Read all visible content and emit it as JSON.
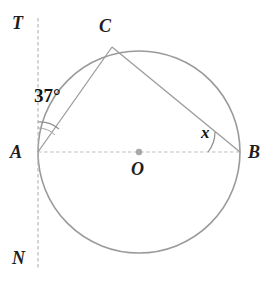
{
  "figure": {
    "type": "circle-geometry-diagram",
    "background_color": "#ffffff",
    "stroke_color_circle": "#9a9a9a",
    "stroke_color_chord": "#9b9b9b",
    "stroke_color_dashed": "#b5b5b5",
    "text_color": "#1d1d1d"
  },
  "points": [
    {
      "id": "A",
      "label": "A",
      "x": 38,
      "y": 152,
      "role": "tangent-point-left-end-of-diameter"
    },
    {
      "id": "B",
      "label": "B",
      "x": 240,
      "y": 152,
      "role": "right-end-of-diameter"
    },
    {
      "id": "C",
      "label": "C",
      "x": 112,
      "y": 47,
      "role": "point-on-circle"
    },
    {
      "id": "O",
      "label": "O",
      "x": 139,
      "y": 152,
      "role": "center"
    },
    {
      "id": "T",
      "label": "T",
      "x": 38,
      "y": 20,
      "role": "tangent-line-top-end"
    },
    {
      "id": "N",
      "label": "N",
      "x": 38,
      "y": 268,
      "role": "tangent-line-bottom-end"
    }
  ],
  "circle": {
    "center_x": 139,
    "center_y": 152,
    "radius": 101,
    "label": "circle O"
  },
  "segments": [
    {
      "id": "AB",
      "from": "A",
      "to": "B",
      "style": "dashed",
      "label": "diameter AB"
    },
    {
      "id": "AC",
      "from": "A",
      "to": "C",
      "style": "solid",
      "label": "chord AC"
    },
    {
      "id": "CB",
      "from": "C",
      "to": "B",
      "style": "solid",
      "label": "chord CB"
    },
    {
      "id": "TN",
      "from": "T",
      "to": "N",
      "style": "dashed",
      "label": "tangent line TN"
    }
  ],
  "angles": [
    {
      "id": "angle-TAC",
      "vertex": "A",
      "label": "37°",
      "value": 37,
      "unit": "degrees",
      "between": [
        "AT",
        "AC"
      ],
      "arc_radius": 30
    },
    {
      "id": "angle-ABC",
      "vertex": "B",
      "label": "x",
      "value": null,
      "unit": "unknown",
      "between": [
        "BA",
        "BC"
      ],
      "arc_radius": 32
    }
  ],
  "labels": {
    "T": "T",
    "N": "N",
    "A": "A",
    "B": "B",
    "C": "C",
    "O": "O",
    "angle_at_A": "37°",
    "angle_at_B": "x"
  }
}
